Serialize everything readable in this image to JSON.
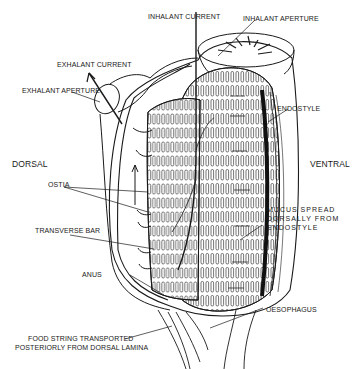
{
  "diagram": {
    "orientation": {
      "left": "DORSAL",
      "right": "VENTRAL"
    },
    "labels": {
      "inhalant_current": "INHALANT CURRENT",
      "inhalant_aperture": "INHALANT APERTURE",
      "exhalant_current": "EXHALANT CURRENT",
      "exhalant_aperture": "EXHALANT APERTURE",
      "endostyle": "ENDOSTYLE",
      "ostia": "OSTIA",
      "transverse_bar": "TRANSVERSE BAR",
      "mucus_line1": "MUCUS SPREAD",
      "mucus_line2": "DORSALLY FROM",
      "mucus_line3": "ENDOSTYLE",
      "anus": "ANUS",
      "oesophagus": "OESOPHAGUS",
      "food_line1": "FOOD STRING TRANSPORTED",
      "food_line2": "POSTERIORLY FROM DORSAL LAMINA"
    },
    "colors": {
      "ink": "#1a1a1a",
      "background": "#ffffff"
    }
  }
}
